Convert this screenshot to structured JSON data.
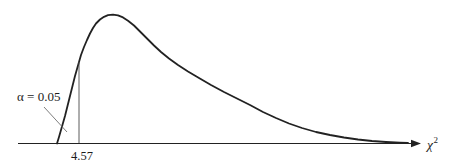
{
  "figure": {
    "ink_color": "#222222",
    "background_color": "#ffffff",
    "alpha_label": "α = 0.05",
    "critical_value_label": "4.57",
    "axis_symbol": "χ",
    "axis_exponent": "2"
  },
  "chart_data": {
    "type": "area",
    "title": "",
    "xlabel": "χ²",
    "ylabel": "",
    "curve": "right-skewed chi-square probability density curve (no numeric y-axis shown)",
    "alpha": 0.05,
    "critical_value": 4.57,
    "tail": "left",
    "x_ticks": [
      4.57
    ],
    "axes": {
      "x_axis_visible": true,
      "y_axis_visible": false,
      "grid": false,
      "x_axis_arrow": "right"
    },
    "annotations": [
      {
        "text": "α = 0.05",
        "points_to": "area under curve left of χ² = 4.57"
      }
    ],
    "curve_points_px": [
      [
        57,
        143.5
      ],
      [
        59,
        137
      ],
      [
        61,
        130
      ],
      [
        63,
        123
      ],
      [
        65,
        116
      ],
      [
        67,
        108
      ],
      [
        69,
        100
      ],
      [
        71,
        92
      ],
      [
        73,
        84
      ],
      [
        75,
        76
      ],
      [
        77,
        69
      ],
      [
        79,
        62
      ],
      [
        81,
        55
      ],
      [
        84,
        47
      ],
      [
        87,
        40
      ],
      [
        90,
        33.5
      ],
      [
        93,
        28
      ],
      [
        96,
        23.5
      ],
      [
        100,
        19.5
      ],
      [
        104,
        16.8
      ],
      [
        108,
        15.2
      ],
      [
        113,
        14.6
      ],
      [
        118,
        15.4
      ],
      [
        123,
        17.4
      ],
      [
        128,
        20.8
      ],
      [
        134,
        25.5
      ],
      [
        140,
        31.5
      ],
      [
        147,
        38.5
      ],
      [
        154,
        45.5
      ],
      [
        161,
        52
      ],
      [
        169,
        58.5
      ],
      [
        178,
        65
      ],
      [
        188,
        71.5
      ],
      [
        199,
        78
      ],
      [
        211,
        85
      ],
      [
        224,
        92
      ],
      [
        237,
        98.5
      ],
      [
        250,
        105
      ],
      [
        263,
        112
      ],
      [
        276,
        118
      ],
      [
        289,
        123.5
      ],
      [
        302,
        128
      ],
      [
        316,
        132
      ],
      [
        330,
        135
      ],
      [
        344,
        137.5
      ],
      [
        358,
        139.5
      ],
      [
        372,
        141
      ],
      [
        386,
        142
      ],
      [
        400,
        142.7
      ],
      [
        408,
        143
      ]
    ]
  }
}
